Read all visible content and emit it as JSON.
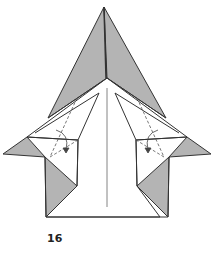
{
  "figure": {
    "type": "origami-step-diagram",
    "step_label": "16",
    "colors": {
      "colored_side": "#b4b4b4",
      "white_side": "#ffffff",
      "line": "#333333"
    },
    "annotations": [
      {
        "kind": "valley-fold-line",
        "side": "left",
        "style": "dashed"
      },
      {
        "kind": "fold-arrow",
        "side": "left",
        "direction": "down"
      },
      {
        "kind": "valley-fold-line",
        "side": "right",
        "style": "dashed"
      },
      {
        "kind": "fold-arrow",
        "side": "right",
        "direction": "down"
      },
      {
        "kind": "center-crease",
        "style": "thin-line"
      }
    ]
  }
}
